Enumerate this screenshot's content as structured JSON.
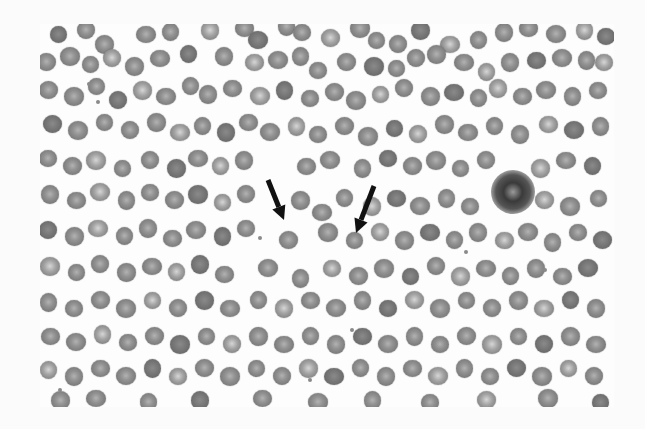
{
  "image": {
    "description": "Grayscale peripheral blood smear micrograph with two black arrows pointing at red blood cells",
    "frame": {
      "x": 40,
      "y": 24,
      "width": 574,
      "height": 383
    },
    "colors": {
      "background": "#fdfdfd",
      "cell": "#7c7c7c",
      "arrow": "#111111"
    }
  },
  "annotations": {
    "arrows": [
      {
        "label": "arrow-1",
        "tail": [
          268,
          180
        ],
        "tip": [
          284,
          220
        ]
      },
      {
        "label": "arrow-2",
        "tail": [
          374,
          186
        ],
        "tip": [
          356,
          233
        ]
      }
    ],
    "leukocyte": {
      "cx": 513,
      "cy": 192,
      "r": 22
    }
  },
  "cells": [
    [
      58,
      34,
      18
    ],
    [
      86,
      30,
      18
    ],
    [
      104,
      44,
      18
    ],
    [
      146,
      34,
      18
    ],
    [
      170,
      32,
      18
    ],
    [
      210,
      30,
      18
    ],
    [
      244,
      28,
      18
    ],
    [
      258,
      40,
      18
    ],
    [
      286,
      26,
      18
    ],
    [
      302,
      32,
      18
    ],
    [
      330,
      38,
      18
    ],
    [
      360,
      28,
      18
    ],
    [
      376,
      40,
      18
    ],
    [
      398,
      44,
      18
    ],
    [
      420,
      30,
      18
    ],
    [
      450,
      44,
      18
    ],
    [
      478,
      40,
      18
    ],
    [
      504,
      32,
      18
    ],
    [
      528,
      28,
      18
    ],
    [
      556,
      34,
      18
    ],
    [
      584,
      30,
      18
    ],
    [
      606,
      36,
      18
    ],
    [
      46,
      62,
      18
    ],
    [
      70,
      56,
      18
    ],
    [
      90,
      64,
      18
    ],
    [
      112,
      58,
      18
    ],
    [
      134,
      66,
      18
    ],
    [
      160,
      58,
      18
    ],
    [
      188,
      54,
      18
    ],
    [
      224,
      56,
      18
    ],
    [
      254,
      62,
      18
    ],
    [
      278,
      60,
      18
    ],
    [
      300,
      56,
      18
    ],
    [
      318,
      70,
      18
    ],
    [
      346,
      62,
      18
    ],
    [
      374,
      66,
      18
    ],
    [
      396,
      68,
      18
    ],
    [
      416,
      58,
      18
    ],
    [
      436,
      54,
      18
    ],
    [
      464,
      62,
      18
    ],
    [
      486,
      72,
      18
    ],
    [
      510,
      62,
      18
    ],
    [
      536,
      60,
      18
    ],
    [
      562,
      58,
      18
    ],
    [
      586,
      60,
      18
    ],
    [
      604,
      62,
      18
    ],
    [
      48,
      90,
      18
    ],
    [
      74,
      96,
      18
    ],
    [
      96,
      86,
      18
    ],
    [
      118,
      100,
      18
    ],
    [
      142,
      90,
      18
    ],
    [
      166,
      96,
      18
    ],
    [
      190,
      86,
      18
    ],
    [
      208,
      94,
      18
    ],
    [
      232,
      88,
      18
    ],
    [
      260,
      96,
      18
    ],
    [
      284,
      90,
      18
    ],
    [
      310,
      98,
      18
    ],
    [
      334,
      92,
      18
    ],
    [
      356,
      100,
      18
    ],
    [
      380,
      94,
      18
    ],
    [
      404,
      88,
      18
    ],
    [
      430,
      96,
      18
    ],
    [
      454,
      92,
      18
    ],
    [
      478,
      98,
      18
    ],
    [
      498,
      88,
      18
    ],
    [
      522,
      96,
      18
    ],
    [
      546,
      90,
      18
    ],
    [
      572,
      96,
      18
    ],
    [
      598,
      90,
      18
    ],
    [
      52,
      124,
      18
    ],
    [
      78,
      130,
      18
    ],
    [
      104,
      122,
      18
    ],
    [
      130,
      130,
      18
    ],
    [
      156,
      122,
      18
    ],
    [
      180,
      132,
      18
    ],
    [
      202,
      126,
      18
    ],
    [
      226,
      132,
      18
    ],
    [
      248,
      122,
      18
    ],
    [
      270,
      132,
      18
    ],
    [
      296,
      126,
      18
    ],
    [
      318,
      134,
      18
    ],
    [
      344,
      126,
      18
    ],
    [
      368,
      136,
      18
    ],
    [
      394,
      128,
      18
    ],
    [
      418,
      134,
      18
    ],
    [
      444,
      124,
      18
    ],
    [
      468,
      132,
      18
    ],
    [
      494,
      126,
      18
    ],
    [
      520,
      134,
      18
    ],
    [
      548,
      124,
      18
    ],
    [
      574,
      130,
      18
    ],
    [
      600,
      126,
      18
    ],
    [
      48,
      158,
      18
    ],
    [
      72,
      166,
      18
    ],
    [
      96,
      160,
      18
    ],
    [
      122,
      168,
      18
    ],
    [
      150,
      160,
      18
    ],
    [
      176,
      168,
      18
    ],
    [
      198,
      158,
      18
    ],
    [
      220,
      166,
      18
    ],
    [
      244,
      160,
      18
    ],
    [
      306,
      166,
      18
    ],
    [
      330,
      160,
      18
    ],
    [
      362,
      168,
      18
    ],
    [
      388,
      158,
      18
    ],
    [
      412,
      166,
      18
    ],
    [
      436,
      160,
      18
    ],
    [
      460,
      168,
      18
    ],
    [
      486,
      160,
      18
    ],
    [
      540,
      168,
      18
    ],
    [
      566,
      160,
      18
    ],
    [
      592,
      166,
      18
    ],
    [
      50,
      194,
      18
    ],
    [
      76,
      200,
      18
    ],
    [
      100,
      192,
      18
    ],
    [
      126,
      200,
      18
    ],
    [
      150,
      192,
      18
    ],
    [
      174,
      200,
      18
    ],
    [
      198,
      194,
      18
    ],
    [
      222,
      202,
      18
    ],
    [
      246,
      194,
      18
    ],
    [
      300,
      200,
      18
    ],
    [
      322,
      212,
      18
    ],
    [
      344,
      198,
      18
    ],
    [
      372,
      206,
      18
    ],
    [
      396,
      198,
      18
    ],
    [
      420,
      206,
      18
    ],
    [
      446,
      198,
      18
    ],
    [
      470,
      206,
      18
    ],
    [
      544,
      200,
      18
    ],
    [
      570,
      206,
      18
    ],
    [
      598,
      198,
      18
    ],
    [
      48,
      230,
      18
    ],
    [
      74,
      236,
      18
    ],
    [
      98,
      228,
      18
    ],
    [
      124,
      236,
      18
    ],
    [
      148,
      228,
      18
    ],
    [
      172,
      238,
      18
    ],
    [
      196,
      230,
      18
    ],
    [
      222,
      236,
      18
    ],
    [
      246,
      228,
      18
    ],
    [
      288,
      240,
      18
    ],
    [
      328,
      232,
      18
    ],
    [
      354,
      240,
      18
    ],
    [
      380,
      232,
      18
    ],
    [
      404,
      240,
      18
    ],
    [
      430,
      232,
      18
    ],
    [
      454,
      240,
      18
    ],
    [
      478,
      232,
      18
    ],
    [
      504,
      240,
      18
    ],
    [
      528,
      232,
      18
    ],
    [
      552,
      242,
      18
    ],
    [
      578,
      232,
      18
    ],
    [
      602,
      240,
      18
    ],
    [
      50,
      266,
      18
    ],
    [
      76,
      272,
      18
    ],
    [
      100,
      264,
      18
    ],
    [
      126,
      272,
      18
    ],
    [
      152,
      266,
      18
    ],
    [
      176,
      272,
      18
    ],
    [
      200,
      264,
      18
    ],
    [
      224,
      274,
      18
    ],
    [
      268,
      268,
      18
    ],
    [
      300,
      278,
      18
    ],
    [
      332,
      268,
      18
    ],
    [
      358,
      276,
      18
    ],
    [
      384,
      268,
      18
    ],
    [
      410,
      276,
      18
    ],
    [
      436,
      266,
      18
    ],
    [
      460,
      276,
      18
    ],
    [
      486,
      268,
      18
    ],
    [
      510,
      276,
      18
    ],
    [
      536,
      268,
      18
    ],
    [
      562,
      276,
      18
    ],
    [
      588,
      268,
      18
    ],
    [
      48,
      302,
      18
    ],
    [
      74,
      308,
      18
    ],
    [
      100,
      300,
      18
    ],
    [
      126,
      308,
      18
    ],
    [
      152,
      300,
      18
    ],
    [
      178,
      308,
      18
    ],
    [
      204,
      300,
      18
    ],
    [
      230,
      308,
      18
    ],
    [
      258,
      300,
      18
    ],
    [
      284,
      308,
      18
    ],
    [
      310,
      300,
      18
    ],
    [
      336,
      308,
      18
    ],
    [
      362,
      300,
      18
    ],
    [
      388,
      308,
      18
    ],
    [
      414,
      300,
      18
    ],
    [
      440,
      308,
      18
    ],
    [
      466,
      300,
      18
    ],
    [
      492,
      308,
      18
    ],
    [
      518,
      300,
      18
    ],
    [
      544,
      308,
      18
    ],
    [
      570,
      300,
      18
    ],
    [
      596,
      308,
      18
    ],
    [
      50,
      336,
      18
    ],
    [
      76,
      342,
      18
    ],
    [
      102,
      334,
      18
    ],
    [
      128,
      342,
      18
    ],
    [
      154,
      336,
      18
    ],
    [
      180,
      344,
      18
    ],
    [
      206,
      336,
      18
    ],
    [
      232,
      344,
      18
    ],
    [
      258,
      336,
      18
    ],
    [
      284,
      344,
      18
    ],
    [
      310,
      336,
      18
    ],
    [
      336,
      344,
      18
    ],
    [
      362,
      336,
      18
    ],
    [
      388,
      344,
      18
    ],
    [
      414,
      336,
      18
    ],
    [
      440,
      344,
      18
    ],
    [
      466,
      336,
      18
    ],
    [
      492,
      344,
      18
    ],
    [
      518,
      336,
      18
    ],
    [
      544,
      344,
      18
    ],
    [
      570,
      336,
      18
    ],
    [
      596,
      344,
      18
    ],
    [
      48,
      370,
      18
    ],
    [
      74,
      376,
      18
    ],
    [
      100,
      368,
      18
    ],
    [
      126,
      376,
      18
    ],
    [
      152,
      368,
      18
    ],
    [
      178,
      376,
      18
    ],
    [
      204,
      368,
      18
    ],
    [
      230,
      376,
      18
    ],
    [
      256,
      368,
      18
    ],
    [
      282,
      376,
      18
    ],
    [
      308,
      368,
      18
    ],
    [
      334,
      376,
      18
    ],
    [
      360,
      368,
      18
    ],
    [
      386,
      376,
      18
    ],
    [
      412,
      368,
      18
    ],
    [
      438,
      376,
      18
    ],
    [
      464,
      368,
      18
    ],
    [
      490,
      376,
      18
    ],
    [
      516,
      368,
      18
    ],
    [
      542,
      376,
      18
    ],
    [
      568,
      368,
      18
    ],
    [
      594,
      376,
      18
    ],
    [
      60,
      400,
      18
    ],
    [
      96,
      398,
      18
    ],
    [
      148,
      402,
      18
    ],
    [
      200,
      400,
      18
    ],
    [
      262,
      398,
      18
    ],
    [
      318,
      402,
      18
    ],
    [
      372,
      400,
      18
    ],
    [
      430,
      402,
      18
    ],
    [
      486,
      400,
      18
    ],
    [
      548,
      398,
      18
    ],
    [
      600,
      402,
      18
    ]
  ],
  "platelets": [
    [
      89,
      84
    ],
    [
      98,
      102
    ],
    [
      260,
      238
    ],
    [
      352,
      330
    ],
    [
      466,
      252
    ],
    [
      545,
      270
    ],
    [
      60,
      390
    ],
    [
      310,
      380
    ]
  ]
}
